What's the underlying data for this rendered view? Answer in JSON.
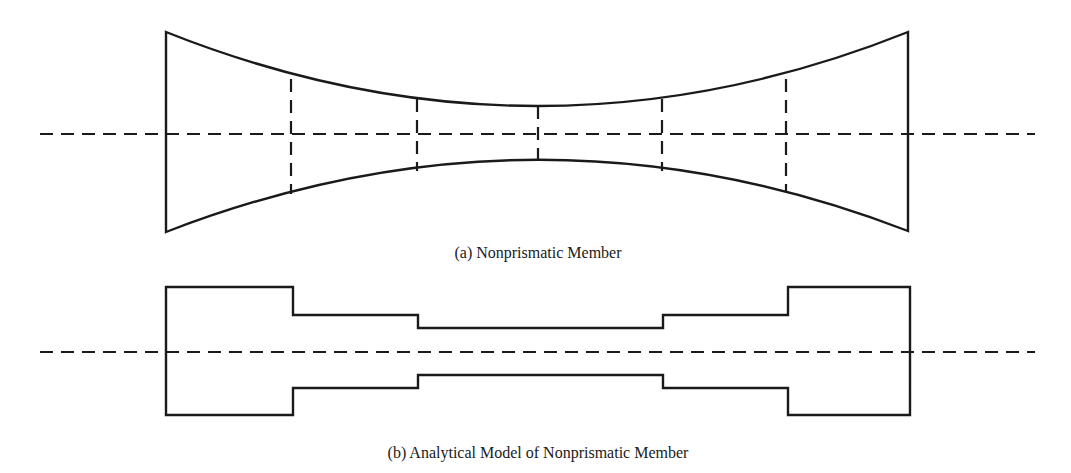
{
  "figure": {
    "panel_a": {
      "caption": "(a) Nonprismatic Member",
      "caption_pos": {
        "x": 538,
        "y": 244
      }
    },
    "panel_b": {
      "caption": "(b) Analytical Model of Nonprismatic Member",
      "caption_pos": {
        "x": 538,
        "y": 444
      }
    },
    "colors": {
      "line": "#1a1a1a",
      "background": "#ffffff"
    }
  }
}
